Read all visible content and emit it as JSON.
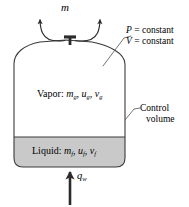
{
  "figure": {
    "colors": {
      "outline": "#3a3a3a",
      "liquid_fill": "#c9c9c9",
      "vapor_fill": "#ffffff",
      "text": "#000000",
      "arrow": "#2b2b2b"
    }
  },
  "mass_flow": {
    "symbol": "m",
    "overdot": "˙",
    "name": "mass-flow-rate"
  },
  "constants": [
    {
      "symbol": "P",
      "relation": "= constant"
    },
    {
      "symbol": "V",
      "relation": "= constant"
    }
  ],
  "vapor": {
    "phase_label": "Vapor:",
    "properties": [
      {
        "symbol": "m",
        "subscript": "g",
        "separator": ","
      },
      {
        "symbol": "u",
        "subscript": "g",
        "separator": ","
      },
      {
        "symbol": "v",
        "subscript": "g",
        "separator": ""
      }
    ]
  },
  "liquid": {
    "phase_label": "Liquid:",
    "properties": [
      {
        "symbol": "m",
        "subscript": "f",
        "separator": ","
      },
      {
        "symbol": "u",
        "subscript": "f",
        "separator": ","
      },
      {
        "symbol": "v",
        "subscript": "f",
        "separator": ""
      }
    ]
  },
  "control_volume": {
    "line1": "Control",
    "line2": "volume"
  },
  "heat_input": {
    "symbol": "q",
    "subscript": "w"
  }
}
